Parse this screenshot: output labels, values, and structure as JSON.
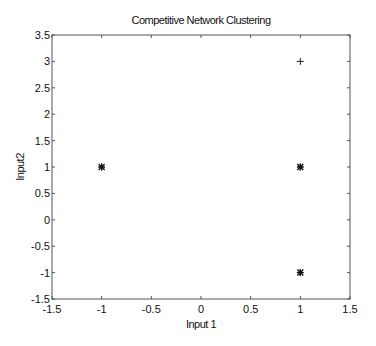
{
  "chart_data": {
    "type": "scatter",
    "title": "Competitive Network Clustering",
    "xlabel": "Input 1",
    "ylabel": "Input2",
    "xlim": [
      -1.5,
      1.5
    ],
    "ylim": [
      -1.5,
      3.5
    ],
    "xticks": [
      -1.5,
      -1,
      -0.5,
      0,
      0.5,
      1,
      1.5
    ],
    "xtick_labels": [
      "-1.5",
      "-1",
      "-0.5",
      "0",
      "0.5",
      "1",
      "1.5"
    ],
    "yticks": [
      -1.5,
      -1,
      -0.5,
      0,
      0.5,
      1,
      1.5,
      2,
      2.5,
      3,
      3.5
    ],
    "ytick_labels": [
      "-1.5",
      "-1",
      "-0.5",
      "0",
      "0.5",
      "1",
      "1.5",
      "2",
      "2.5",
      "3",
      "3.5"
    ],
    "grid": false,
    "series": [
      {
        "name": "input vectors",
        "marker": "+",
        "points": [
          [
            -1,
            1
          ],
          [
            1,
            1
          ],
          [
            1,
            -1
          ],
          [
            1,
            3
          ]
        ]
      },
      {
        "name": "neuron weights",
        "marker": "*",
        "points": [
          [
            -1,
            1
          ],
          [
            1,
            1
          ],
          [
            1,
            -1
          ]
        ]
      }
    ]
  }
}
